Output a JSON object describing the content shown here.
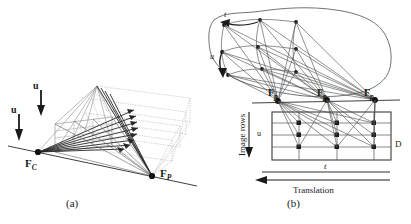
{
  "figure": {
    "background_color": "#ffffff",
    "ink_color": "#1a1a1a",
    "faint_color": "#b9b9b9",
    "width": 411,
    "height": 224,
    "captions": {
      "left": "(a)",
      "right": "(b)"
    }
  },
  "panel_a": {
    "name": "camera-and-pattern-focal-geometry",
    "labels": {
      "u_top": "u",
      "u_left": "u",
      "fc_base": "F",
      "fc_sub": "C",
      "fp_base": "F",
      "fp_sub": "P"
    },
    "geometry": {
      "focal_point_camera": [
        38,
        152
      ],
      "focal_point_pattern": [
        152,
        176
      ],
      "apex": [
        97,
        86
      ],
      "baseline_start": [
        8,
        147
      ],
      "baseline_end": [
        196,
        185
      ],
      "image_plane_quad": [
        [
          55,
          124
        ],
        [
          112,
          117
        ],
        [
          112,
          145
        ],
        [
          55,
          152
        ]
      ],
      "dotted_planes": 4,
      "ray_count": 8
    }
  },
  "panel_b": {
    "name": "epipolar-plane-image-volume",
    "labels": {
      "t_surface": "t",
      "u_surface": "u",
      "fp1_base": "F",
      "fp1_sub": "p",
      "fp2_base": "F",
      "fp2_sub": "p",
      "fp3_base": "F",
      "fp3_sub": "p",
      "image_rows": "Image rows",
      "u_axis": "u",
      "t_axis": "t",
      "translation": "Translation",
      "d_label": "D"
    },
    "geometry": {
      "surface_grid_rows": 3,
      "surface_grid_cols": 3,
      "focal_points": [
        [
          278,
          100
        ],
        [
          327,
          100
        ],
        [
          375,
          100
        ]
      ],
      "epi_rect": [
        [
          272,
          112
        ],
        [
          391,
          112
        ],
        [
          391,
          160
        ],
        [
          272,
          160
        ]
      ],
      "epi_grid_rows": 3,
      "epi_grid_cols": 3,
      "translation_arrow": [
        [
          388,
          180
        ],
        [
          258,
          180
        ]
      ]
    }
  }
}
